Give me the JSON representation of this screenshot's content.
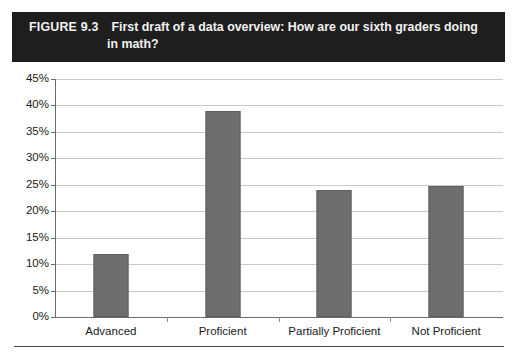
{
  "figure": {
    "label": "FIGURE 9.3",
    "title_line_1": "First draft of a data overview: How are our sixth graders doing",
    "title_line_2": "in math?",
    "banner_color": "#1e1e1e",
    "banner_text_color": "#f2f2f2"
  },
  "chart_data": {
    "type": "bar",
    "title": "First draft of a data overview: How are our sixth graders doing in math?",
    "categories": [
      "Advanced",
      "Proficient",
      "Partially Proficient",
      "Not Proficient"
    ],
    "values": [
      12.0,
      39.0,
      24.0,
      24.7
    ],
    "value_labels": [
      "12%",
      "39%",
      "24%",
      "24.7%"
    ],
    "xlabel": "",
    "ylabel": "",
    "ylim": [
      0,
      45
    ],
    "ytick_step": 5,
    "ytick_labels": [
      "0%",
      "5%",
      "10%",
      "15%",
      "20%",
      "25%",
      "30%",
      "35%",
      "40%",
      "45%"
    ],
    "ytick_values": [
      0,
      5,
      10,
      15,
      20,
      25,
      30,
      35,
      40,
      45
    ],
    "grid": true,
    "grid_axis": "y",
    "legend": false,
    "bar_color": "#6e6e6e",
    "grid_color": "#c9c9c9",
    "axis_color": "#6b6b6b"
  }
}
